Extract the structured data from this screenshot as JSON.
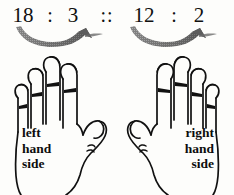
{
  "figure": {
    "background_color": "#fdfdfb",
    "ink_color": "#101010",
    "arrow_color": "#8a8a8a"
  },
  "proportion": {
    "term_a": "18",
    "colon_1": ":",
    "term_b": "3",
    "proportion_sign": "::",
    "term_c": "12",
    "colon_2": ":",
    "term_d": "2",
    "full_expression": "18 : 3 :: 12 : 2"
  },
  "arrows": {
    "left": {
      "name": "curved-arrow-left-ratio",
      "direction": "rightward",
      "style": "halftone-swoosh"
    },
    "right": {
      "name": "curved-arrow-right-ratio",
      "direction": "rightward",
      "style": "halftone-swoosh"
    }
  },
  "hands": {
    "left": {
      "label_lines": [
        "left",
        "hand",
        "side"
      ],
      "label_text": "left hand side",
      "thumb_direction": "right",
      "finger_count": 4
    },
    "right": {
      "label_lines": [
        "right",
        "hand",
        "side"
      ],
      "label_text": "right hand side",
      "thumb_direction": "left",
      "finger_count": 4
    }
  }
}
